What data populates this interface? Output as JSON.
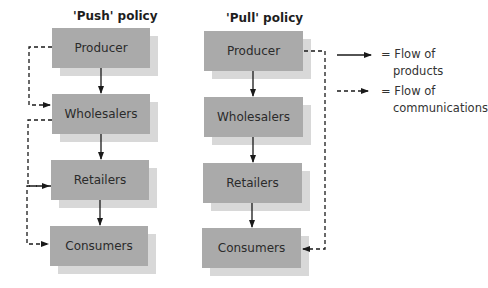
{
  "push": {
    "title": "'Push' policy",
    "boxes": [
      "Producer",
      "Wholesalers",
      "Retailers",
      "Consumers"
    ]
  },
  "pull": {
    "title": "'Pull' policy",
    "boxes": [
      "Producer",
      "Wholesalers",
      "Retailers",
      "Consumers"
    ]
  },
  "legend": {
    "solid": {
      "line1": "= Flow of",
      "line2": "products"
    },
    "dashed": {
      "line1": "= Flow of",
      "line2": "communications"
    }
  },
  "colors": {
    "box": "#aaaaaa",
    "shadow": "#d8d8d8",
    "line": "#1a1a1a"
  }
}
